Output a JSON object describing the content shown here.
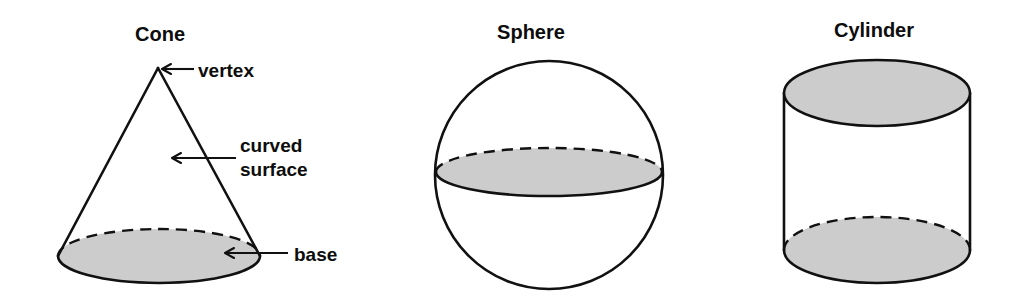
{
  "figure": {
    "kind": "geometry-diagram",
    "background_color": "#ffffff",
    "ink_color": "#111111",
    "shaded_face_color": "#cccccc"
  },
  "shapes": [
    {
      "id": "cone",
      "title": "Cone",
      "title_x": 160,
      "title_y": 41,
      "parts": [
        {
          "id": "vertex",
          "label": "vertex"
        },
        {
          "id": "curved-surface",
          "label_line1": "curved",
          "label_line2": "surface"
        },
        {
          "id": "base",
          "label": "base"
        }
      ]
    },
    {
      "id": "sphere",
      "title": "Sphere",
      "title_x": 531,
      "title_y": 39,
      "parts": []
    },
    {
      "id": "cylinder",
      "title": "Cylinder",
      "title_x": 874,
      "title_y": 37,
      "parts": []
    }
  ],
  "callouts": {
    "vertex": {
      "text": "vertex",
      "x": 198,
      "y": 77
    },
    "curved_surface_line1": {
      "text": "curved",
      "x": 240,
      "y": 152
    },
    "curved_surface_line2": {
      "text": "surface",
      "x": 240,
      "y": 176
    },
    "base": {
      "text": "base",
      "x": 294,
      "y": 261
    }
  }
}
